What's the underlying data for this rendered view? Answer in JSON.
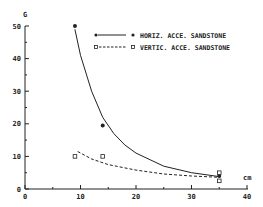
{
  "chart_data": {
    "type": "scatter",
    "title": "",
    "xlabel": "cm",
    "ylabel": "G",
    "xlim": [
      0,
      40
    ],
    "ylim": [
      0,
      50
    ],
    "x_ticks": [
      0,
      10,
      20,
      30,
      40
    ],
    "y_ticks": [
      0,
      10,
      20,
      30,
      40,
      50
    ],
    "grid": false,
    "legend_position": "upper right",
    "series": [
      {
        "name": "HORIZ. ACCE. SANDSTONE",
        "marker": "filled-circle",
        "line": "solid",
        "x": [
          9,
          14,
          35
        ],
        "y": [
          50,
          19.5,
          4
        ],
        "fit_curve": [
          [
            9,
            49
          ],
          [
            10,
            41
          ],
          [
            12,
            30
          ],
          [
            14,
            22
          ],
          [
            16,
            17
          ],
          [
            18,
            13.5
          ],
          [
            20,
            11
          ],
          [
            25,
            7
          ],
          [
            30,
            5
          ],
          [
            35,
            3.8
          ]
        ]
      },
      {
        "name": "VERTIC. ACCE. SANDSTONE",
        "marker": "open-square",
        "line": "dashed",
        "x": [
          9,
          14,
          35,
          35
        ],
        "y": [
          10,
          10,
          5,
          2.5
        ],
        "fit_curve": [
          [
            9.5,
            11.5
          ],
          [
            12,
            9.2
          ],
          [
            15,
            7.5
          ],
          [
            20,
            5.8
          ],
          [
            25,
            4.6
          ],
          [
            30,
            4.0
          ],
          [
            35,
            3.6
          ]
        ]
      }
    ]
  },
  "axes": {
    "y_label": "G",
    "x_label": "cm",
    "y_tick_labels": [
      "0",
      "10",
      "20",
      "30",
      "40",
      "50"
    ],
    "x_tick_labels": [
      "0",
      "10",
      "20",
      "30",
      "40"
    ]
  },
  "legend": {
    "items": [
      {
        "label": "HORIZ. ACCE. SANDSTONE"
      },
      {
        "label": "VERTIC. ACCE. SANDSTONE"
      }
    ]
  }
}
